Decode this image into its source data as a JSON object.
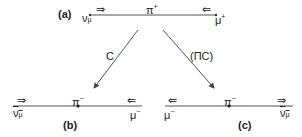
{
  "panels": {
    "a": {
      "label": "(a)",
      "particle_center": "π",
      "particle_center_charge": "+",
      "left_particle": "ν",
      "left_particle_sub": "μ",
      "right_particle": "μ",
      "right_particle_charge": "+",
      "left_spin_arrow": "⇒",
      "right_spin_arrow": "⇐"
    },
    "b": {
      "label": "(b)",
      "particle_center": "π",
      "particle_center_charge": "−",
      "left_particle": "ν",
      "left_particle_sub": "μ",
      "right_particle": "μ",
      "right_particle_charge": "−",
      "left_spin_arrow": "⇒",
      "right_spin_arrow": "⇐"
    },
    "c": {
      "label": "(c)",
      "particle_center": "π",
      "particle_center_charge": "−",
      "left_particle": "μ",
      "left_particle_charge": "−",
      "right_particle": "ν",
      "right_particle_sub": "μ",
      "left_spin_arrow": "⇐",
      "right_spin_arrow": "⇒"
    }
  },
  "transforms": {
    "left": "C",
    "right": "(ΠC)"
  },
  "colors": {
    "line": "#555555",
    "text": "#222222"
  }
}
